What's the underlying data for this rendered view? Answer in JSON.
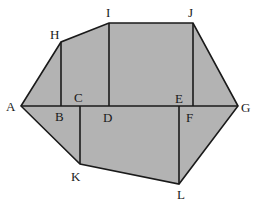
{
  "diagram": {
    "fill_color": "#b3b3b3",
    "stroke_color": "#1a1a1a",
    "points": {
      "A": [
        21,
        106
      ],
      "B": [
        61,
        106
      ],
      "C": [
        80,
        106
      ],
      "D": [
        109,
        106
      ],
      "E": [
        193,
        106
      ],
      "F": [
        179,
        106
      ],
      "G": [
        238,
        106
      ],
      "H": [
        61,
        42
      ],
      "I": [
        109,
        23
      ],
      "J": [
        193,
        23
      ],
      "K": [
        80,
        164
      ],
      "L": [
        179,
        184
      ]
    },
    "polygon": [
      "A",
      "H",
      "I",
      "J",
      "G",
      "L",
      "K"
    ],
    "segments": [
      [
        "A",
        "G"
      ],
      [
        "H",
        "B"
      ],
      [
        "I",
        "D"
      ],
      [
        "J",
        "E"
      ],
      [
        "C",
        "K"
      ],
      [
        "F",
        "L"
      ]
    ],
    "labels": {
      "A": "A",
      "B": "B",
      "C": "C",
      "D": "D",
      "E": "E",
      "F": "F",
      "G": "G",
      "H": "H",
      "I": "I",
      "J": "J",
      "K": "K",
      "L": "L"
    }
  }
}
